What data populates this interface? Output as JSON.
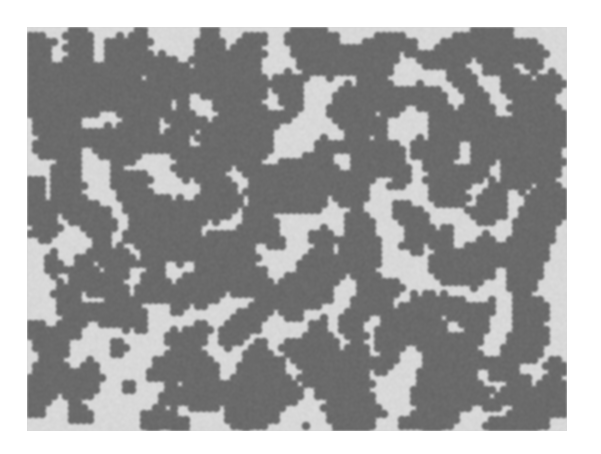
{
  "image": {
    "description": "grayscale micrograph of a dispersed two-phase pattern: dark irregular blobs on a light gray matrix",
    "frame": {
      "x": 27,
      "y": 27,
      "width": 540,
      "height": 404
    },
    "colors": {
      "page_background": "#ffffff",
      "matrix": "#d8d8d8",
      "particles": "#6a6a6a"
    },
    "pattern": {
      "seed": 7,
      "cell": 6,
      "coverage": 0.4,
      "cluster_passes": 3
    }
  }
}
